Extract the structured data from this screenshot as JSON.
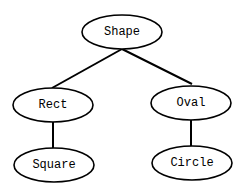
{
  "diagram": {
    "type": "tree",
    "nodes": [
      {
        "id": "shape",
        "label": "Shape"
      },
      {
        "id": "rect",
        "label": "Rect"
      },
      {
        "id": "oval",
        "label": "Oval"
      },
      {
        "id": "square",
        "label": "Square"
      },
      {
        "id": "circle",
        "label": "Circle"
      }
    ],
    "edges": [
      {
        "from": "shape",
        "to": "rect"
      },
      {
        "from": "shape",
        "to": "oval"
      },
      {
        "from": "rect",
        "to": "square"
      },
      {
        "from": "oval",
        "to": "circle"
      }
    ],
    "colors": {
      "stroke": "#000000",
      "fill": "#ffffff",
      "background": "#ffffff"
    }
  }
}
